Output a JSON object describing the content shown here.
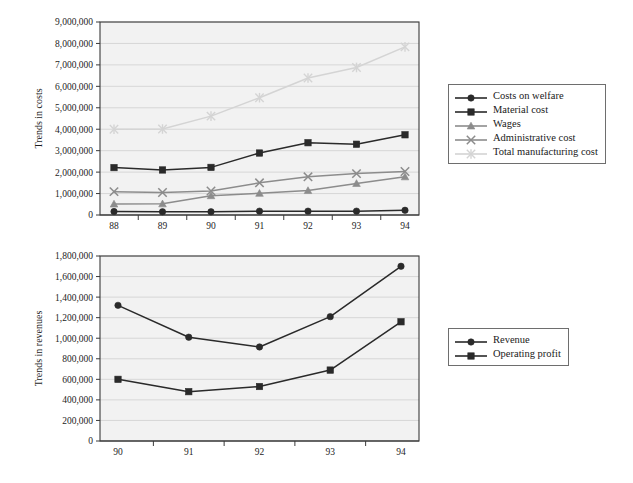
{
  "figure": {
    "background_color": "#ffffff",
    "plot_background_color": "#f2f2f2",
    "gridline_color": "#cfcfcf",
    "frame_color": "#3a3a3a"
  },
  "chart_data": [
    {
      "id": "trends-in-costs",
      "type": "line",
      "title": "",
      "xlabel": "",
      "ylabel": "Trends in costs",
      "categories": [
        "88",
        "89",
        "90",
        "91",
        "92",
        "93",
        "94"
      ],
      "x_tick_labels": [
        "88",
        "89",
        "90",
        "91",
        "92",
        "93",
        "94"
      ],
      "y_tick_labels": [
        "0",
        "1,000,000",
        "2,000,000",
        "3,000,000",
        "4,000,000",
        "5,000,000",
        "6,000,000",
        "7,000,000",
        "8,000,000",
        "9,000,000"
      ],
      "ylim": [
        0,
        9000000
      ],
      "y_tick_step": 1000000,
      "grid": true,
      "legend_position": "right",
      "series": [
        {
          "name": "Costs on welfare",
          "color": "#2a2a2a",
          "marker": "circle",
          "values": [
            160000,
            150000,
            150000,
            180000,
            180000,
            180000,
            220000
          ]
        },
        {
          "name": "Material cost",
          "color": "#2a2a2a",
          "marker": "square",
          "values": [
            2210000,
            2100000,
            2220000,
            2890000,
            3370000,
            3300000,
            3740000
          ]
        },
        {
          "name": "Wages",
          "color": "#8c8c8c",
          "marker": "triangle",
          "values": [
            510000,
            520000,
            900000,
            1010000,
            1140000,
            1470000,
            1780000
          ]
        },
        {
          "name": "Administrative cost",
          "color": "#8c8c8c",
          "marker": "cross",
          "values": [
            1090000,
            1050000,
            1120000,
            1500000,
            1780000,
            1930000,
            2030000
          ]
        },
        {
          "name": "Total manufacturing cost",
          "color": "#d4d4d4",
          "marker": "asterisk",
          "values": [
            4000000,
            4010000,
            4610000,
            5470000,
            6390000,
            6880000,
            7840000
          ]
        }
      ]
    },
    {
      "id": "trends-in-revenues",
      "type": "line",
      "title": "",
      "xlabel": "",
      "ylabel": "Trends in revenues",
      "categories": [
        "90",
        "91",
        "92",
        "93",
        "94"
      ],
      "x_tick_labels": [
        "90",
        "91",
        "92",
        "93",
        "94"
      ],
      "y_tick_labels": [
        "0",
        "200,000",
        "400,000",
        "600,000",
        "800,000",
        "1,000,000",
        "1,200,000",
        "1,400,000",
        "1,600,000",
        "1,800,000"
      ],
      "ylim": [
        0,
        1800000
      ],
      "y_tick_step": 200000,
      "grid": true,
      "legend_position": "right",
      "series": [
        {
          "name": "Revenue",
          "color": "#2a2a2a",
          "marker": "circle",
          "values": [
            1320000,
            1010000,
            915000,
            1210000,
            1700000
          ]
        },
        {
          "name": "Operating profit",
          "color": "#2a2a2a",
          "marker": "square",
          "values": [
            600000,
            480000,
            530000,
            690000,
            1160000
          ]
        }
      ]
    }
  ]
}
